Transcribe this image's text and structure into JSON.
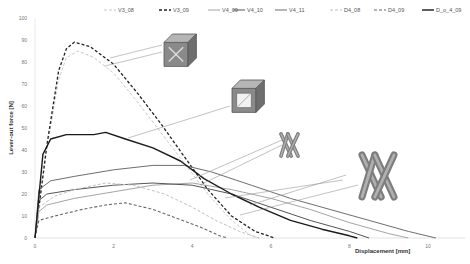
{
  "chart_data": {
    "type": "line",
    "title": "",
    "xlabel": "Displacement [mm]",
    "ylabel": "Lever-out force [N]",
    "xlim": [
      0,
      10
    ],
    "ylim": [
      0,
      100
    ],
    "x_ticks": [
      0,
      2,
      4,
      6,
      8,
      10
    ],
    "y_ticks": [
      0,
      10,
      20,
      30,
      40,
      50,
      60,
      70,
      80,
      90,
      100
    ],
    "grid": false,
    "legend_position": "top",
    "series": [
      {
        "name": "V3_08",
        "style": "dashed",
        "color": "#c8c8c8",
        "width": 1,
        "points": [
          [
            0,
            0
          ],
          [
            0.3,
            40
          ],
          [
            0.6,
            72
          ],
          [
            0.8,
            82
          ],
          [
            1.1,
            85
          ],
          [
            1.5,
            82
          ],
          [
            2.0,
            75
          ],
          [
            2.6,
            62
          ],
          [
            3.2,
            48
          ],
          [
            3.8,
            34
          ],
          [
            4.4,
            20
          ],
          [
            5.0,
            8
          ],
          [
            5.5,
            1
          ],
          [
            5.7,
            0
          ]
        ]
      },
      {
        "name": "V3_09",
        "style": "dashed",
        "color": "#222222",
        "width": 1.3,
        "points": [
          [
            0,
            0
          ],
          [
            0.3,
            42
          ],
          [
            0.6,
            76
          ],
          [
            0.8,
            86
          ],
          [
            1.0,
            89
          ],
          [
            1.4,
            87
          ],
          [
            2.0,
            79
          ],
          [
            2.6,
            66
          ],
          [
            3.2,
            52
          ],
          [
            3.8,
            37
          ],
          [
            4.4,
            22
          ],
          [
            5.0,
            10
          ],
          [
            5.6,
            3
          ],
          [
            6.1,
            0
          ]
        ]
      },
      {
        "name": "V4_09",
        "style": "solid",
        "color": "#9a9a9a",
        "width": 0.9,
        "points": [
          [
            0,
            0
          ],
          [
            0.1,
            12
          ],
          [
            0.3,
            15
          ],
          [
            1.0,
            18
          ],
          [
            2.0,
            21
          ],
          [
            3.0,
            24
          ],
          [
            4.0,
            25
          ],
          [
            5.0,
            22
          ],
          [
            6.0,
            18
          ],
          [
            7.0,
            13
          ],
          [
            8.0,
            7
          ],
          [
            9.0,
            2
          ],
          [
            9.5,
            0
          ]
        ]
      },
      {
        "name": "V4_10",
        "style": "solid",
        "color": "#555555",
        "width": 1,
        "points": [
          [
            0,
            0
          ],
          [
            0.1,
            17
          ],
          [
            0.3,
            20
          ],
          [
            1.0,
            22
          ],
          [
            2.0,
            24
          ],
          [
            3.0,
            25
          ],
          [
            4.0,
            24
          ],
          [
            5.0,
            20
          ],
          [
            6.0,
            14
          ],
          [
            7.0,
            8
          ],
          [
            8.0,
            3
          ],
          [
            8.5,
            0
          ]
        ]
      },
      {
        "name": "V4_11",
        "style": "solid",
        "color": "#6e6e6e",
        "width": 1,
        "points": [
          [
            0,
            0
          ],
          [
            0.1,
            22
          ],
          [
            0.4,
            26
          ],
          [
            1.0,
            28
          ],
          [
            2.0,
            31
          ],
          [
            3.0,
            33
          ],
          [
            3.8,
            33
          ],
          [
            4.5,
            30
          ],
          [
            5.5,
            24
          ],
          [
            6.5,
            18
          ],
          [
            7.5,
            13
          ],
          [
            8.5,
            8
          ],
          [
            9.5,
            3
          ],
          [
            10.2,
            0
          ]
        ]
      },
      {
        "name": "D4_08",
        "style": "dashed",
        "color": "#c0c0c0",
        "width": 1,
        "points": [
          [
            0,
            0
          ],
          [
            0.1,
            14
          ],
          [
            0.5,
            19
          ],
          [
            1.0,
            22
          ],
          [
            1.8,
            25
          ],
          [
            2.5,
            24
          ],
          [
            3.3,
            20
          ],
          [
            4.0,
            14
          ],
          [
            4.6,
            8
          ],
          [
            5.2,
            3
          ],
          [
            5.7,
            0
          ]
        ]
      },
      {
        "name": "D4_09",
        "style": "dashed",
        "color": "#666666",
        "width": 1.1,
        "points": [
          [
            0,
            0
          ],
          [
            0.1,
            8
          ],
          [
            0.5,
            10
          ],
          [
            1.2,
            13
          ],
          [
            1.8,
            15
          ],
          [
            2.3,
            16
          ],
          [
            3.0,
            13
          ],
          [
            3.6,
            9
          ],
          [
            4.2,
            5
          ],
          [
            4.7,
            1
          ],
          [
            4.9,
            0
          ]
        ]
      },
      {
        "name": "D_o_4_09",
        "style": "solid",
        "color": "#1a1a1a",
        "width": 1.4,
        "points": [
          [
            0,
            0
          ],
          [
            0.2,
            38
          ],
          [
            0.4,
            45
          ],
          [
            0.8,
            47
          ],
          [
            1.5,
            47
          ],
          [
            1.8,
            48
          ],
          [
            2.3,
            45
          ],
          [
            3.0,
            41
          ],
          [
            3.7,
            35
          ],
          [
            4.3,
            27
          ],
          [
            5.0,
            20
          ],
          [
            5.7,
            14
          ],
          [
            6.5,
            8
          ],
          [
            7.3,
            4
          ],
          [
            8.0,
            1
          ],
          [
            8.2,
            0
          ]
        ]
      }
    ],
    "annotations": [
      {
        "label": "V3 lattice cube (small)",
        "shape": "cube-lattice",
        "points_to": "V3_08/V3_09"
      },
      {
        "label": "D_o_4 lattice cube",
        "shape": "cube-frame",
        "points_to": "D_o_4_09"
      },
      {
        "label": "V4 X-shaped beam (small)",
        "shape": "x-beam",
        "points_to": "V4 series"
      },
      {
        "label": "D4 X-shaped beam (large)",
        "shape": "x-beam-large",
        "points_to": "D4 series"
      }
    ]
  }
}
